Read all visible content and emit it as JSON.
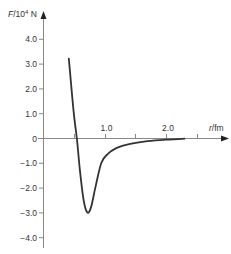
{
  "chart_data": {
    "type": "line",
    "title": "",
    "ylabel_italic": "F",
    "ylabel_rest": "/10",
    "ylabel_exp": "4",
    "ylabel_unit": " N",
    "xlabel_italic": "r",
    "xlabel_rest": "/fm",
    "x_ticks": [
      0.5,
      1.0,
      1.5,
      2.0,
      2.5
    ],
    "x_tick_labels": [
      {
        "value": 1.0,
        "label": "1.0"
      },
      {
        "value": 2.0,
        "label": "2.0"
      }
    ],
    "y_ticks": [
      4.0,
      3.0,
      2.0,
      1.0,
      0,
      -1.0,
      -2.0,
      -3.0,
      -4.0
    ],
    "y_tick_labels": [
      "4.0",
      "3.0",
      "2.0",
      "1.0",
      "0",
      "−1.0",
      "−2.0",
      "−3.0",
      "−4.0"
    ],
    "xlim": [
      0,
      2.9
    ],
    "ylim": [
      -4.4,
      4.6
    ],
    "grid": false,
    "legend": null,
    "series": [
      {
        "name": "F(r)",
        "color": "#333333",
        "points": [
          [
            0.42,
            3.2
          ],
          [
            0.5,
            1.0
          ],
          [
            0.55,
            0.0
          ],
          [
            0.6,
            -1.3
          ],
          [
            0.66,
            -2.5
          ],
          [
            0.72,
            -3.0
          ],
          [
            0.78,
            -2.8
          ],
          [
            0.86,
            -1.9
          ],
          [
            0.95,
            -1.0
          ],
          [
            1.05,
            -0.65
          ],
          [
            1.2,
            -0.4
          ],
          [
            1.4,
            -0.25
          ],
          [
            1.7,
            -0.13
          ],
          [
            2.0,
            -0.07
          ],
          [
            2.3,
            -0.03
          ]
        ]
      }
    ]
  },
  "layout": {
    "origin_x": 43,
    "origin_y": 138,
    "px_per_x": 61.5,
    "px_per_y": 24.8
  }
}
